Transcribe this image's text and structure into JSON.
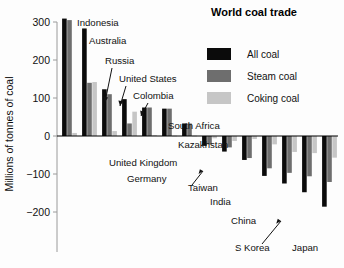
{
  "chart_data": {
    "type": "bar",
    "title": "World coal trade",
    "xlabel": "",
    "ylabel": "Millions of tonnes of coal",
    "ylim": [
      -200,
      310
    ],
    "yticks": [
      300,
      200,
      100,
      0,
      -100,
      -200
    ],
    "ytick_labels": [
      "300",
      "200",
      "100",
      "0",
      "−100",
      "−200"
    ],
    "grid": false,
    "legend_position": "top-right",
    "categories": [
      "Indonesia",
      "Australia",
      "Russia",
      "United States",
      "Colombia",
      "South Africa",
      "Kazakhstan",
      "United Kingdom",
      "Germany",
      "Taiwan",
      "India",
      "China",
      "S Korea",
      "Japan"
    ],
    "series": [
      {
        "name": "All coal",
        "color": "#0b0b0b",
        "values": [
          309,
          283,
          123,
          97,
          75,
          72,
          33,
          -26,
          -41,
          -63,
          -105,
          -125,
          -148,
          -186
        ]
      },
      {
        "name": "Steam coal",
        "color": "#6e6e6e",
        "values": [
          305,
          140,
          110,
          33,
          75,
          72,
          33,
          -22,
          -30,
          -58,
          -85,
          -97,
          -106,
          -121
        ]
      },
      {
        "name": "Coking coal",
        "color": "#c6c6c6",
        "values": [
          8,
          142,
          13,
          64,
          2,
          1,
          1,
          -6,
          -13,
          -8,
          -22,
          -42,
          -45,
          -57
        ]
      }
    ],
    "annotations": [
      {
        "label": "Indonesia",
        "style": "plain"
      },
      {
        "label": "Australia",
        "style": "plain"
      },
      {
        "label": "Russia",
        "style": "arrow"
      },
      {
        "label": "United States",
        "style": "arrow"
      },
      {
        "label": "Colombia",
        "style": "arrow"
      },
      {
        "label": "South Africa",
        "style": "plain"
      },
      {
        "label": "Kazakhstan",
        "style": "plain"
      },
      {
        "label": "United Kingdom",
        "style": "plain"
      },
      {
        "label": "Germany",
        "style": "plain"
      },
      {
        "label": "Taiwan",
        "style": "arrow"
      },
      {
        "label": "India",
        "style": "plain"
      },
      {
        "label": "China",
        "style": "plain"
      },
      {
        "label": "S Korea",
        "style": "arrow"
      },
      {
        "label": "Japan",
        "style": "plain"
      }
    ]
  },
  "legend": {
    "items": [
      {
        "label": "All coal",
        "color": "#0b0b0b"
      },
      {
        "label": "Steam coal",
        "color": "#6e6e6e"
      },
      {
        "label": "Coking coal",
        "color": "#c6c6c6"
      }
    ]
  },
  "axis": {
    "y_title": "Millions of tonnes of coal",
    "tick_0": "300",
    "tick_1": "200",
    "tick_2": "100",
    "tick_3": "0",
    "tick_4": "−100",
    "tick_5": "−200"
  },
  "labels": {
    "indonesia": "Indonesia",
    "australia": "Australia",
    "russia": "Russia",
    "united_states": "United States",
    "colombia": "Colombia",
    "south_africa": "South Africa",
    "kazakhstan": "Kazakhstan",
    "united_kingdom": "United Kingdom",
    "germany": "Germany",
    "taiwan": "Taiwan",
    "india": "India",
    "china": "China",
    "s_korea": "S Korea",
    "japan": "Japan"
  },
  "title": "World coal trade"
}
